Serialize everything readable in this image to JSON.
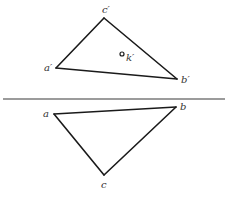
{
  "diagram": {
    "type": "orthographic-projection",
    "colors": {
      "edge": "#1a1a1a",
      "axis": "#7a7a7a",
      "label": "#333333",
      "background": "#ffffff"
    },
    "axis": {
      "x1": 3,
      "y1": 99,
      "x2": 225,
      "y2": 99
    },
    "front_view": {
      "points": {
        "a_prime": {
          "label": "a′",
          "x": 56,
          "y": 68,
          "label_x": 44,
          "label_y": 71
        },
        "b_prime": {
          "label": "b′",
          "x": 177,
          "y": 79,
          "label_x": 181,
          "label_y": 83
        },
        "c_prime": {
          "label": "c′",
          "x": 104,
          "y": 18,
          "label_x": 102,
          "label_y": 13
        }
      },
      "inner_point": {
        "label": "k′",
        "x": 122,
        "y": 54,
        "r": 2,
        "label_x": 126,
        "label_y": 61
      }
    },
    "top_view": {
      "points": {
        "a": {
          "label": "a",
          "x": 54,
          "y": 114,
          "label_x": 43,
          "label_y": 117
        },
        "b": {
          "label": "b",
          "x": 176,
          "y": 107,
          "label_x": 180,
          "label_y": 110
        },
        "c": {
          "label": "c",
          "x": 104,
          "y": 175,
          "label_x": 101,
          "label_y": 188
        }
      }
    }
  }
}
